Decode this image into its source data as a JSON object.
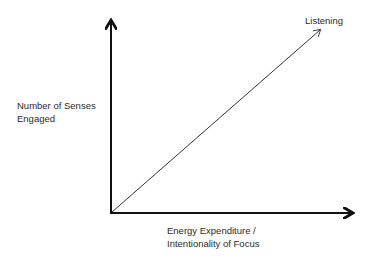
{
  "diagram": {
    "y_axis_label": [
      "Number of Senses",
      "Engaged"
    ],
    "x_axis_label": [
      "Energy Expenditure /",
      "Intentionality of Focus"
    ],
    "line_label": "Listening",
    "colors": {
      "axis": "#111111",
      "line": "#333333",
      "text": "#2a2a2a"
    }
  }
}
